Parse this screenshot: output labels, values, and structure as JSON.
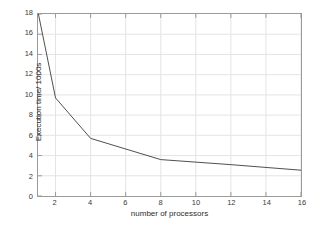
{
  "chart_data": {
    "type": "line",
    "title": "",
    "xlabel": "number of processors",
    "ylabel": "Execution time/ 1000s",
    "xlim": [
      1,
      16
    ],
    "ylim": [
      0,
      18
    ],
    "grid": true,
    "legend": null,
    "xticks": [
      2,
      4,
      6,
      8,
      10,
      12,
      14,
      16
    ],
    "xtick_labels": [
      "2",
      "4",
      "6",
      "8",
      "10",
      "12",
      "14",
      "16"
    ],
    "yticks": [
      0,
      2,
      4,
      6,
      8,
      10,
      12,
      14,
      16,
      18
    ],
    "ytick_labels": [
      "0",
      "2",
      "4",
      "6",
      "8",
      "10",
      "12",
      "14",
      "16",
      "18"
    ],
    "series": [
      {
        "name": "execution time",
        "color": "#4d4d4d",
        "x": [
          1,
          2,
          4,
          8,
          12,
          16
        ],
        "values": [
          18.2,
          9.7,
          5.7,
          3.6,
          3.1,
          2.55
        ]
      }
    ]
  },
  "style": {
    "axis_color": "#9a9a9a",
    "grid_color": "#e4e4e4",
    "tick_text_color": "#3a3a3a",
    "label_text_color": "#2b2b2b",
    "background": "#ffffff"
  }
}
